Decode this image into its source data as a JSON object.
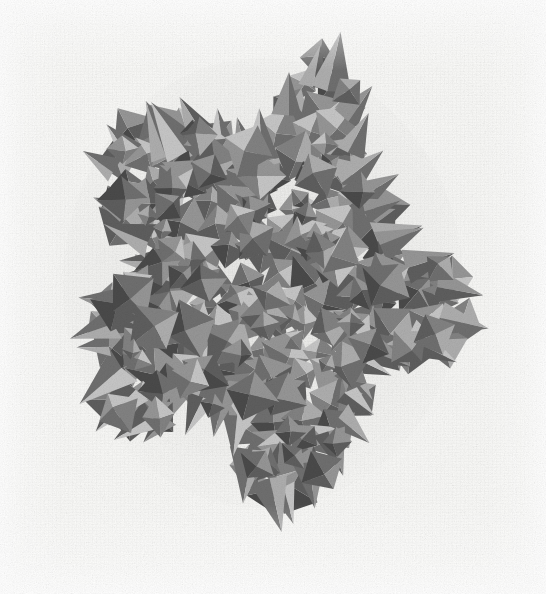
{
  "image": {
    "kind": "scanned-photograph",
    "subject": "polyhedral-cluster-model",
    "description": "Grayscale scanned photograph of a dense cluster of triangular-faceted polyhedra (tetrahedra and octahedra) forming a roughly circular aggregate with a jagged spiky silhouette",
    "width": 546,
    "height": 594,
    "caption": "",
    "title": "",
    "alt_text": "Cluster of interlocking shaded tetrahedra and octahedra on a pale scanned paper background"
  },
  "colors": {
    "background": "#fbfbf9",
    "page_white": "#ffffff",
    "facet_darkest": "#4a4a4a",
    "facet_dark": "#5e5e5e",
    "facet_mid_dark": "#6f6f6f",
    "facet_mid": "#828282",
    "facet_mid_light": "#969696",
    "facet_light": "#aeaeae",
    "facet_lightest": "#c6c6c6",
    "edge_shadow": "#3d3d3d"
  },
  "cluster": {
    "center_x": 263,
    "center_y": 283,
    "bounds": {
      "left": 78,
      "top": 70,
      "right": 448,
      "bottom": 495
    },
    "approx_width": 370,
    "approx_height": 425,
    "facet_count": 248,
    "tone_levels": 7
  },
  "chart_data": {
    "type": "scatter",
    "title": "",
    "xlabel": "",
    "ylabel": "",
    "note": "not-a-chart; pixel figure only"
  }
}
